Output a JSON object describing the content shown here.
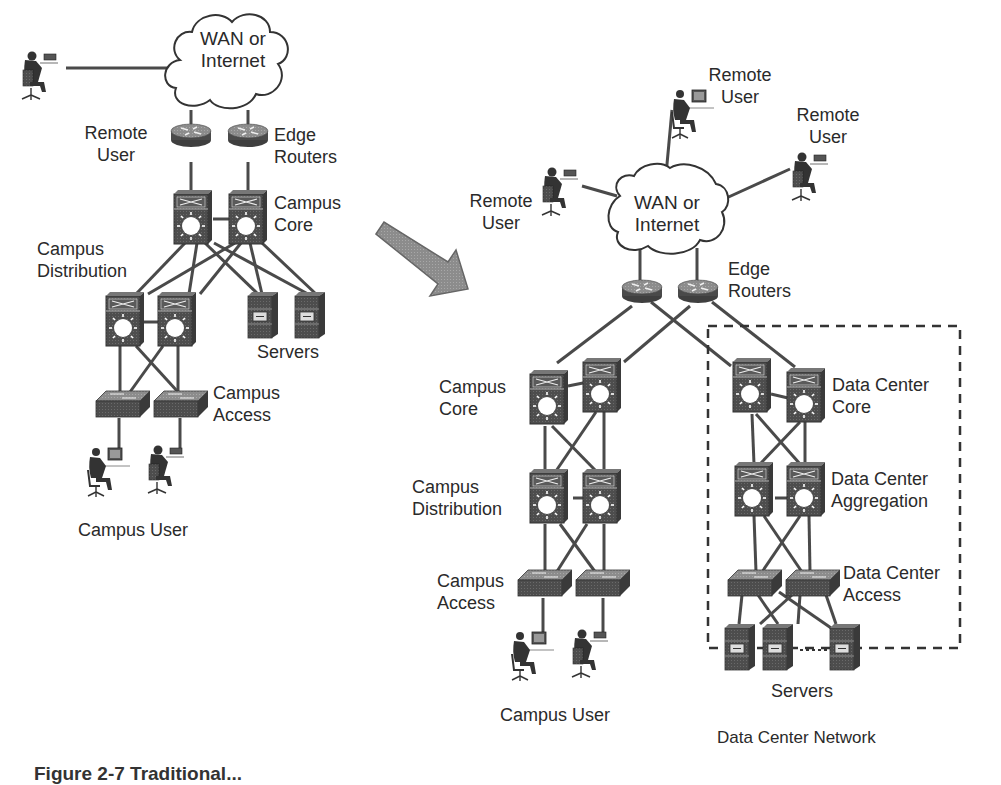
{
  "figure": {
    "caption_partial": "Figure 2-7 Traditional...",
    "arrow": "transition-arrow"
  },
  "left_network": {
    "cloud": {
      "line1": "WAN or",
      "line2": "Internet"
    },
    "remote_user": {
      "line1": "Remote",
      "line2": "User"
    },
    "edge_routers": {
      "line1": "Edge",
      "line2": "Routers"
    },
    "campus_core": {
      "line1": "Campus",
      "line2": "Core"
    },
    "campus_distribution": {
      "line1": "Campus",
      "line2": "Distribution"
    },
    "servers": "Servers",
    "campus_access": {
      "line1": "Campus",
      "line2": "Access"
    },
    "campus_user": "Campus User"
  },
  "right_network": {
    "cloud": {
      "line1": "WAN or",
      "line2": "Internet"
    },
    "remote_users": [
      {
        "line1": "Remote",
        "line2": "User"
      },
      {
        "line1": "Remote",
        "line2": "User"
      },
      {
        "line1": "Remote",
        "line2": "User"
      }
    ],
    "edge_routers": {
      "line1": "Edge",
      "line2": "Routers"
    },
    "campus_core": {
      "line1": "Campus",
      "line2": "Core"
    },
    "campus_distribution": {
      "line1": "Campus",
      "line2": "Distribution"
    },
    "campus_access": {
      "line1": "Campus",
      "line2": "Access"
    },
    "campus_user": "Campus User",
    "dc_core": {
      "line1": "Data Center",
      "line2": "Core"
    },
    "dc_aggregation": {
      "line1": "Data Center",
      "line2": "Aggregation"
    },
    "dc_access": {
      "line1": "Data Center",
      "line2": "Access"
    },
    "dc_servers": "Servers",
    "dc_network": "Data Center Network"
  },
  "colors": {
    "device": "#4a4a4a",
    "link": "#4a4a4a",
    "arrow": "#8a8a8a",
    "text": "#2a2a2a"
  }
}
